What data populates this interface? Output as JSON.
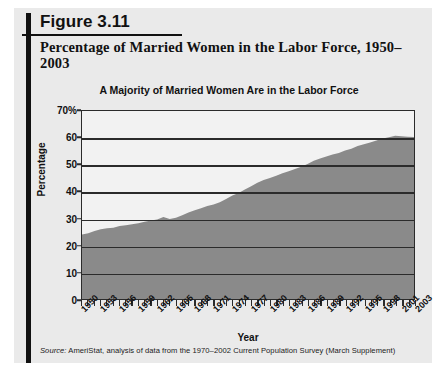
{
  "figure": {
    "number": "Figure 3.11",
    "title": "Percentage of Married Women in the Labor Force, 1950–2003",
    "source_label": "Source:",
    "source_text": " AmeriStat, analysis of data from the 1970–2002 Current Population Survey (March Supplement)"
  },
  "colors": {
    "area_fill": "#8a8a8a",
    "gridline": "#2b2b2b",
    "plot_background": "#f2f2f2",
    "panel_background": "#eaeaea",
    "rule": "#111111"
  },
  "chart_data": {
    "type": "area",
    "title": "A Majority of Married Women Are in the Labor Force",
    "xlabel": "Year",
    "ylabel": "Percentage",
    "ylim": [
      0,
      70
    ],
    "xlim": [
      1950,
      2003
    ],
    "grid": true,
    "legend": "none",
    "ytick_labels": [
      "70%",
      "60",
      "50",
      "40",
      "30",
      "20",
      "10",
      "0"
    ],
    "ytick_values": [
      70,
      60,
      50,
      40,
      30,
      20,
      10,
      0
    ],
    "xtick_labels": [
      "1950",
      "1953",
      "1956",
      "1959",
      "1962",
      "1965",
      "1968",
      "1971",
      "1974",
      "1977",
      "1980",
      "1983",
      "1986",
      "1989",
      "1992",
      "1995",
      "1998",
      "2001",
      "2003"
    ],
    "xtick_values": [
      1950,
      1953,
      1956,
      1959,
      1962,
      1965,
      1968,
      1971,
      1974,
      1977,
      1980,
      1983,
      1986,
      1989,
      1992,
      1995,
      1998,
      2001,
      2003
    ],
    "x": [
      1950,
      1951,
      1952,
      1953,
      1954,
      1955,
      1956,
      1957,
      1958,
      1959,
      1960,
      1961,
      1962,
      1963,
      1964,
      1965,
      1966,
      1967,
      1968,
      1969,
      1970,
      1971,
      1972,
      1973,
      1974,
      1975,
      1976,
      1977,
      1978,
      1979,
      1980,
      1981,
      1982,
      1983,
      1984,
      1985,
      1986,
      1987,
      1988,
      1989,
      1990,
      1991,
      1992,
      1993,
      1994,
      1995,
      1996,
      1997,
      1998,
      1999,
      2000,
      2001,
      2002,
      2003
    ],
    "values": [
      24,
      24.5,
      25.3,
      26,
      26.3,
      26.5,
      27.2,
      27.5,
      27.8,
      28.2,
      28.8,
      29.2,
      29.6,
      30.5,
      29.8,
      30.3,
      31.2,
      32.2,
      33,
      33.8,
      34.6,
      35.2,
      36,
      37.2,
      38.5,
      39.5,
      40.8,
      42,
      43.3,
      44.3,
      45.1,
      45.9,
      46.8,
      47.6,
      48.4,
      49.2,
      50.3,
      51.5,
      52.3,
      53.1,
      53.8,
      54.4,
      55.3,
      55.9,
      57,
      57.6,
      58.3,
      59,
      59.8,
      60.2,
      60.8,
      60.6,
      60.4,
      60.3
    ]
  }
}
